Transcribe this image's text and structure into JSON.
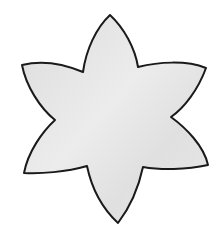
{
  "image": {
    "subject": "six-petal flower outline",
    "fill_color": "#e2e2e2",
    "fill_highlight": "#efefef",
    "stroke_color": "#1a1a1a",
    "background_color": "#ffffff"
  }
}
